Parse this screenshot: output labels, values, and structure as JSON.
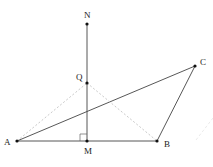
{
  "diagram": {
    "points": {
      "N": {
        "label": "N",
        "x": 87,
        "y": 24
      },
      "Q": {
        "label": "Q",
        "x": 87,
        "y": 83
      },
      "A": {
        "label": "A",
        "x": 17,
        "y": 141
      },
      "M": {
        "label": "M",
        "x": 87,
        "y": 141
      },
      "B": {
        "label": "B",
        "x": 157,
        "y": 141
      },
      "C": {
        "label": "C",
        "x": 195,
        "y": 66
      }
    },
    "solid_segments": [
      "NM",
      "AB",
      "AC",
      "BC"
    ],
    "dashed_segments": [
      "AQ",
      "QB"
    ],
    "right_angle_at": "M",
    "colors": {
      "line": "#333333",
      "dashed": "#bbbbbb",
      "point": "#111111"
    }
  }
}
